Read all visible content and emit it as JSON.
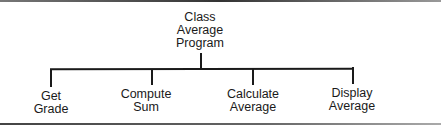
{
  "diagram": {
    "type": "hierarchy-chart",
    "root": {
      "lines": [
        "Class",
        "Average",
        "Program"
      ]
    },
    "children": [
      {
        "lines": [
          "Get",
          "Grade"
        ]
      },
      {
        "lines": [
          "Compute",
          "Sum"
        ]
      },
      {
        "lines": [
          "Calculate",
          "Average"
        ]
      },
      {
        "lines": [
          "Display",
          "Average"
        ]
      }
    ],
    "edges": [
      [
        "Class Average Program",
        "Get Grade"
      ],
      [
        "Class Average Program",
        "Compute Sum"
      ],
      [
        "Class Average Program",
        "Calculate Average"
      ],
      [
        "Class Average Program",
        "Display Average"
      ]
    ]
  }
}
